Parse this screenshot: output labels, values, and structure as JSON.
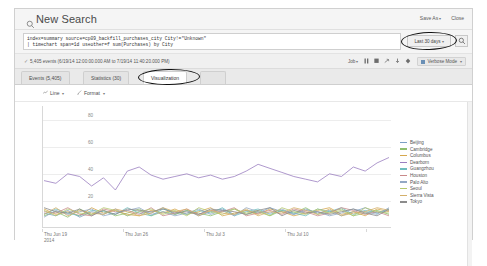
{
  "header": {
    "title": "New Search",
    "search_icon": "magnifier-icon",
    "save_as": "Save As",
    "close": "Close",
    "caret": "▾"
  },
  "search": {
    "query_line1": "index=summary source=cp09_backfill_purchases_city City!=\"Unknown\"",
    "query_line2": "| timechart span=1d useother=f sum(Purchases) by City",
    "time_range": "Last 30 days",
    "go_icon": "magnifier-icon"
  },
  "status": {
    "check_icon": "✓",
    "events_text": "5,405 events (6/19/14 12:00:00.000 AM to 7/19/14 11:40:20.000 PM)",
    "job": "Job",
    "icons": [
      "pause-icon",
      "stop-icon",
      "share-icon",
      "download-icon",
      "print-icon"
    ],
    "icon_glyphs": [
      "❙❙",
      "■",
      "↱",
      "↓",
      "❖"
    ],
    "verbose_mode": "Verbose Mode"
  },
  "tabs": [
    {
      "label": "Events (5,405)",
      "active": false
    },
    {
      "label": "Statistics (30)",
      "active": false
    },
    {
      "label": "Visualization",
      "active": true
    }
  ],
  "chart_toolbar": {
    "chart_type": "Line",
    "chart_type_icon": "line-chart-icon",
    "format": "Format",
    "format_icon": "paintbrush-icon"
  },
  "chart_data": {
    "type": "line",
    "title": "",
    "xlabel": "",
    "ylabel": "",
    "ylim": [
      0,
      90
    ],
    "yticks": [
      20,
      40,
      60,
      80
    ],
    "grid": true,
    "legend_position": "right",
    "xticks": [
      "Thu Jun 19",
      "Thu Jun 26",
      "Thu Jul 3",
      "Thu Jul 10"
    ],
    "xtick_sub": [
      "2014",
      "",
      "",
      ""
    ],
    "x": [
      "Jun 19",
      "Jun 20",
      "Jun 21",
      "Jun 22",
      "Jun 23",
      "Jun 24",
      "Jun 25",
      "Jun 26",
      "Jun 27",
      "Jun 28",
      "Jun 29",
      "Jun 30",
      "Jul 1",
      "Jul 2",
      "Jul 3",
      "Jul 4",
      "Jul 5",
      "Jul 6",
      "Jul 7",
      "Jul 8",
      "Jul 9",
      "Jul 10",
      "Jul 11",
      "Jul 12",
      "Jul 13",
      "Jul 14",
      "Jul 15",
      "Jul 16",
      "Jul 17",
      "Jul 18"
    ],
    "series": [
      {
        "name": "Beijing",
        "color": "#7b9fc4",
        "values": [
          11,
          9,
          13,
          8,
          12,
          10,
          14,
          9,
          12,
          11,
          15,
          10,
          13,
          9,
          12,
          14,
          10,
          13,
          11,
          15,
          12,
          10,
          14,
          11,
          13,
          9,
          12,
          15,
          11,
          13
        ]
      },
      {
        "name": "Cambridge",
        "color": "#8fbf6e",
        "values": [
          9,
          12,
          8,
          14,
          10,
          13,
          9,
          11,
          14,
          9,
          12,
          10,
          13,
          11,
          9,
          12,
          14,
          10,
          12,
          9,
          13,
          11,
          15,
          10,
          12,
          14,
          9,
          11,
          13,
          10
        ]
      },
      {
        "name": "Columbus",
        "color": "#d6a84e",
        "values": [
          14,
          10,
          12,
          9,
          15,
          11,
          13,
          10,
          9,
          13,
          11,
          14,
          10,
          12,
          15,
          9,
          11,
          13,
          10,
          14,
          12,
          9,
          11,
          13,
          15,
          10,
          12,
          9,
          14,
          12
        ]
      },
      {
        "name": "Dearborn",
        "color": "#9b7fc0",
        "values": [
          35,
          33,
          40,
          38,
          31,
          37,
          28,
          42,
          45,
          39,
          36,
          38,
          40,
          37,
          39,
          36,
          38,
          42,
          47,
          44,
          41,
          38,
          36,
          34,
          40,
          38,
          45,
          42,
          48,
          52
        ]
      },
      {
        "name": "Guangzhou",
        "color": "#6ebdbd",
        "values": [
          10,
          14,
          11,
          9,
          13,
          12,
          10,
          15,
          11,
          9,
          14,
          12,
          10,
          13,
          11,
          15,
          9,
          12,
          14,
          10,
          13,
          11,
          9,
          14,
          12,
          15,
          10,
          13,
          11,
          14
        ]
      },
      {
        "name": "Houston",
        "color": "#c98a8a",
        "values": [
          12,
          11,
          15,
          10,
          9,
          14,
          12,
          13,
          10,
          15,
          9,
          11,
          14,
          10,
          13,
          12,
          15,
          9,
          11,
          13,
          10,
          14,
          12,
          9,
          11,
          15,
          13,
          10,
          12,
          9
        ]
      },
      {
        "name": "Palo Alto",
        "color": "#93a8c4",
        "values": [
          8,
          13,
          10,
          12,
          14,
          9,
          11,
          13,
          15,
          10,
          12,
          9,
          11,
          14,
          10,
          13,
          9,
          15,
          12,
          11,
          14,
          10,
          13,
          12,
          9,
          11,
          14,
          12,
          10,
          15
        ]
      },
      {
        "name": "Seoul",
        "color": "#b5c86e",
        "values": [
          13,
          9,
          14,
          11,
          10,
          15,
          13,
          9,
          12,
          14,
          10,
          13,
          9,
          15,
          12,
          10,
          14,
          11,
          13,
          9,
          15,
          12,
          10,
          14,
          11,
          13,
          9,
          15,
          12,
          11
        ]
      },
      {
        "name": "Sierra Vista",
        "color": "#d4b06a",
        "values": [
          10,
          15,
          9,
          13,
          11,
          10,
          14,
          12,
          9,
          11,
          15,
          12,
          14,
          9,
          13,
          11,
          10,
          14,
          9,
          12,
          11,
          15,
          13,
          10,
          14,
          9,
          11,
          12,
          15,
          13
        ]
      },
      {
        "name": "Tokyo",
        "color": "#8c8c8c",
        "values": [
          15,
          12,
          11,
          14,
          9,
          13,
          10,
          14,
          13,
          12,
          14,
          11,
          12,
          10,
          14,
          13,
          12,
          10,
          13,
          15,
          9,
          13,
          11,
          12,
          10,
          12,
          14,
          11,
          9,
          14
        ]
      }
    ]
  }
}
